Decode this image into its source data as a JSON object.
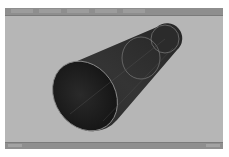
{
  "window": {
    "type": "3d-viewport",
    "background_color": "#b6b6b6",
    "header_color": "#8e8e8e"
  },
  "header": {
    "menu_items": [
      "",
      "",
      "",
      "",
      ""
    ],
    "panel_label": ""
  },
  "viewport": {
    "object": {
      "name": "cone-tube",
      "fill_color": "#2e2e2e",
      "edge_color": "#8a8a8a",
      "wire_color": "#9c9c9c",
      "wireframe_rings": 2
    }
  },
  "statusbar": {
    "left_text": "",
    "right_text": ""
  }
}
